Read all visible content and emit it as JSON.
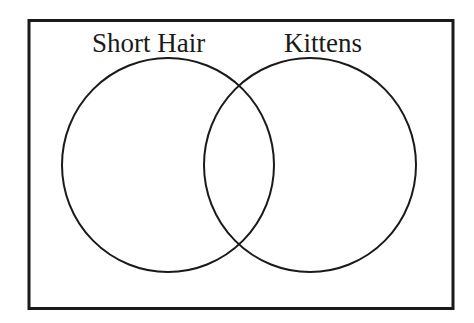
{
  "diagram": {
    "type": "venn",
    "sets": [
      {
        "label": "Short Hair"
      },
      {
        "label": "Kittens"
      }
    ],
    "colors": {
      "stroke": "#1a1a1a",
      "background": "#ffffff"
    }
  }
}
